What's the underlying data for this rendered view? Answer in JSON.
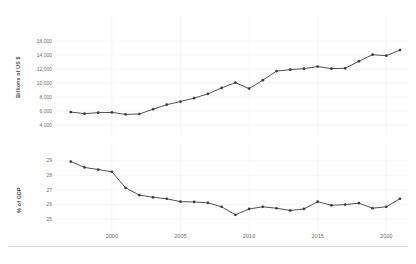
{
  "chart_data": [
    {
      "type": "line",
      "title": "",
      "xlabel": "",
      "ylabel": "Billions of US $",
      "xlim": [
        1996,
        2021
      ],
      "ylim": [
        4000,
        17000
      ],
      "grid": true,
      "legend": "none",
      "xticks": [
        "2000",
        "2005",
        "2010",
        "2015",
        "2020"
      ],
      "xtick_values": [
        2000,
        2005,
        2010,
        2015,
        2020
      ],
      "yticks": [
        "4,000",
        "6,000",
        "8,000",
        "10,000",
        "12,000",
        "14,000",
        "16,000"
      ],
      "ytick_values": [
        4000,
        6000,
        8000,
        10000,
        12000,
        14000,
        16000
      ],
      "x": [
        1997,
        1998,
        1999,
        2000,
        2001,
        2002,
        2003,
        2004,
        2005,
        2006,
        2007,
        2008,
        2009,
        2010,
        2011,
        2012,
        2013,
        2014,
        2015,
        2016,
        2017,
        2018,
        2019,
        2020,
        2021
      ],
      "values": [
        5850,
        5620,
        5760,
        5800,
        5520,
        5570,
        6250,
        6900,
        7350,
        7850,
        8450,
        9300,
        10050,
        9200,
        10400,
        11700,
        11900,
        12050,
        12350,
        12050,
        12100,
        13100,
        14050,
        13900,
        14700
      ],
      "series": [
        {
          "name": "Billions of US $",
          "values": [
            5850,
            5620,
            5760,
            5800,
            5520,
            5570,
            6250,
            6900,
            7350,
            7850,
            8450,
            9300,
            10050,
            9200,
            10400,
            11700,
            11900,
            12050,
            12350,
            12050,
            12100,
            13100,
            14050,
            13900,
            14700
          ]
        }
      ]
    },
    {
      "type": "line",
      "title": "",
      "xlabel": "",
      "ylabel": "% of GDP",
      "xlim": [
        1996,
        2021
      ],
      "ylim": [
        24.6,
        29.4
      ],
      "grid": true,
      "legend": "none",
      "xticks": [
        "2000",
        "2005",
        "2010",
        "2015",
        "2020"
      ],
      "xtick_values": [
        2000,
        2005,
        2010,
        2015,
        2020
      ],
      "yticks": [
        "25",
        "26",
        "27",
        "28",
        "29"
      ],
      "ytick_values": [
        25,
        26,
        27,
        28,
        29
      ],
      "x": [
        1997,
        1998,
        1999,
        2000,
        2001,
        2002,
        2003,
        2004,
        2005,
        2006,
        2007,
        2008,
        2009,
        2010,
        2011,
        2012,
        2013,
        2014,
        2015,
        2016,
        2017,
        2018,
        2019,
        2020,
        2021
      ],
      "values": [
        28.95,
        28.55,
        28.4,
        28.25,
        27.15,
        26.65,
        26.5,
        26.4,
        26.2,
        26.18,
        26.12,
        25.85,
        25.3,
        25.7,
        25.85,
        25.75,
        25.6,
        25.7,
        26.2,
        25.95,
        26.0,
        26.1,
        25.75,
        25.85,
        26.4
      ]
    }
  ],
  "panels": {
    "top": {
      "ylabel": "Billions of US $"
    },
    "bottom": {
      "ylabel": "% of GDP"
    }
  }
}
